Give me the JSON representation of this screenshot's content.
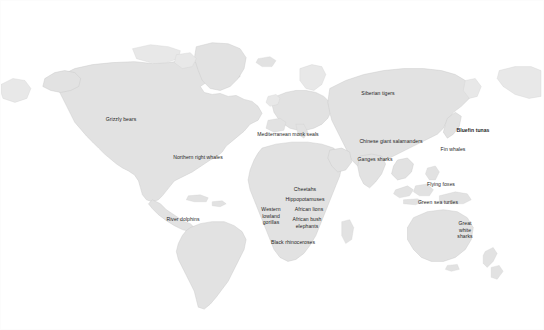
{
  "figure": {
    "background_color": "#ffffff",
    "land_color": "#e2e2e2",
    "land_border_color": "#c9c9c9",
    "label_color": "#1d1d1d"
  },
  "labels": [
    {
      "id": "grizzly-bears",
      "text": "Grizzly bears",
      "x": 120,
      "y": 118,
      "bold": false,
      "region": "North America"
    },
    {
      "id": "northern-right-whales",
      "text": "Northern right whales",
      "x": 197,
      "y": 156,
      "bold": false,
      "region": "North Atlantic"
    },
    {
      "id": "river-dolphins",
      "text": "River dolphins",
      "x": 182,
      "y": 218,
      "bold": false,
      "region": "South America"
    },
    {
      "id": "mediterranean-monk-seals",
      "text": "Mediterranean monk seals",
      "x": 287,
      "y": 133,
      "bold": false,
      "region": "Mediterranean"
    },
    {
      "id": "cheetahs",
      "text": "Cheetahs",
      "x": 304,
      "y": 188,
      "bold": false,
      "region": "Africa"
    },
    {
      "id": "hippopotamuses",
      "text": "Hippopotamuses",
      "x": 304,
      "y": 198,
      "bold": false,
      "region": "Africa"
    },
    {
      "id": "western-lowland-gorillas",
      "text": "Western\nlowland\ngorillas",
      "x": 270,
      "y": 215,
      "bold": false,
      "region": "Central Africa"
    },
    {
      "id": "african-lions",
      "text": "African lions",
      "x": 308,
      "y": 208,
      "bold": false,
      "region": "Africa"
    },
    {
      "id": "african-bush-elephants",
      "text": "African bush\nelephants",
      "x": 306,
      "y": 222,
      "bold": false,
      "region": "Africa"
    },
    {
      "id": "black-rhinoceroses",
      "text": "Black rhinoceroses",
      "x": 292,
      "y": 241,
      "bold": false,
      "region": "Southern Africa"
    },
    {
      "id": "siberian-tigers",
      "text": "Siberian tigers",
      "x": 377,
      "y": 92,
      "bold": false,
      "region": "Siberia"
    },
    {
      "id": "chinese-giant-salamanders",
      "text": "Chinese giant salamanders",
      "x": 390,
      "y": 140,
      "bold": false,
      "region": "China"
    },
    {
      "id": "ganges-sharks",
      "text": "Ganges sharks",
      "x": 374,
      "y": 158,
      "bold": false,
      "region": "South Asia"
    },
    {
      "id": "bluefin-tunas",
      "text": "Bluefin tunas",
      "x": 472,
      "y": 129,
      "bold": true,
      "region": "North Pacific"
    },
    {
      "id": "fin-whales",
      "text": "Fin whales",
      "x": 452,
      "y": 148,
      "bold": false,
      "region": "North Pacific"
    },
    {
      "id": "flying-foxes",
      "text": "Flying foxes",
      "x": 440,
      "y": 183,
      "bold": false,
      "region": "Southeast Asia"
    },
    {
      "id": "green-sea-turtles",
      "text": "Green sea turtles",
      "x": 437,
      "y": 201,
      "bold": false,
      "region": "Coral Sea"
    },
    {
      "id": "great-white-sharks",
      "text": "Great\nwhite\nsharks",
      "x": 464,
      "y": 229,
      "bold": false,
      "region": "Oceania"
    }
  ]
}
